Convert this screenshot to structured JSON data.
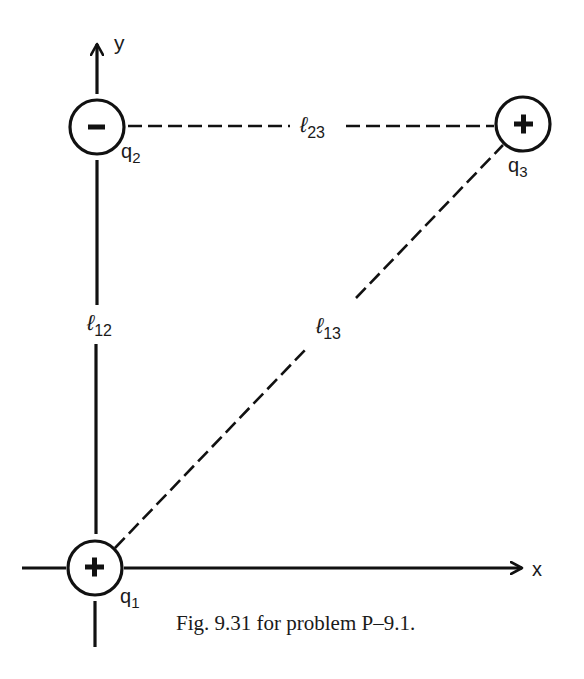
{
  "figure": {
    "caption": "Fig. 9.31 for problem P–9.1."
  },
  "axes": {
    "x_label": "x",
    "y_label": "y"
  },
  "charges": [
    {
      "id": "q1",
      "name": "q",
      "subscript": "1",
      "sign": "+",
      "sign_glyph": "plus-icon"
    },
    {
      "id": "q2",
      "name": "q",
      "subscript": "2",
      "sign": "−",
      "sign_glyph": "minus-icon"
    },
    {
      "id": "q3",
      "name": "q",
      "subscript": "3",
      "sign": "+",
      "sign_glyph": "plus-icon"
    }
  ],
  "distances": [
    {
      "id": "l12",
      "symbol": "ℓ",
      "subscript": "12",
      "between": [
        "q1",
        "q2"
      ]
    },
    {
      "id": "l23",
      "symbol": "ℓ",
      "subscript": "23",
      "between": [
        "q2",
        "q3"
      ]
    },
    {
      "id": "l13",
      "symbol": "ℓ",
      "subscript": "13",
      "between": [
        "q1",
        "q3"
      ]
    }
  ],
  "colors": {
    "ink": "#111111",
    "background": "#ffffff"
  }
}
